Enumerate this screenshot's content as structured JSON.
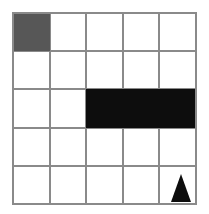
{
  "figure": {
    "kind": "grid-figure",
    "background_color": "#ffffff",
    "width": 209,
    "height": 214
  },
  "grid": {
    "name": "5x5-grid",
    "rows": 5,
    "columns": 5,
    "left": 13,
    "top": 13,
    "right": 196,
    "bottom": 204,
    "cell_width": 36.6,
    "cell_height": 38.2,
    "line_color": "#8a8a8a",
    "line_width": 2,
    "x_lines": [
      13,
      49.6,
      86.2,
      122.8,
      159.4,
      196
    ],
    "y_lines": [
      13,
      51.2,
      89.4,
      127.6,
      165.8,
      204
    ]
  },
  "shapes": [
    {
      "name": "gray-square",
      "type": "rect",
      "fill": "#575757",
      "row": 1,
      "column": 1,
      "x": 13,
      "y": 13,
      "width": 36.6,
      "height": 38.2,
      "description": "dark gray filled cell, top-left"
    },
    {
      "name": "black-bar",
      "type": "rect",
      "fill": "#0d0d0d",
      "row": 3,
      "column_start": 3,
      "column_end": 5,
      "x": 86.2,
      "y": 89.4,
      "width": 109.8,
      "height": 38.2,
      "description": "solid black horizontal bar spanning three cells in the middle row"
    },
    {
      "name": "black-triangle",
      "type": "triangle",
      "fill": "#0d0d0d",
      "row": 5,
      "column": 5,
      "apex_x": 181,
      "apex_y": 174,
      "base_left_x": 171,
      "base_right_x": 191,
      "base_y": 202,
      "description": "upward-pointing black triangle in bottom-right cell"
    }
  ]
}
